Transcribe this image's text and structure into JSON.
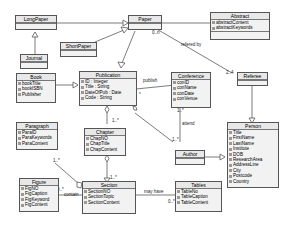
{
  "classes": {
    "longpaper": {
      "name": "LongPaper"
    },
    "paper": {
      "name": "Paper"
    },
    "abstract": {
      "name": "Abstract",
      "attrs": [
        "abstractContent",
        "abstractKeywords"
      ]
    },
    "journal": {
      "name": "Journal"
    },
    "shortpaper": {
      "name": "ShortPaper"
    },
    "book": {
      "name": "Book",
      "attrs": [
        "bookTitle",
        "bookISBN",
        "Publisher"
      ]
    },
    "publication": {
      "name": "Publication",
      "attrs": [
        "ID : Integer",
        "Title : String",
        "DateOfPub : Date",
        "Code : String"
      ]
    },
    "conference": {
      "name": "Conference",
      "attrs": [
        "conID",
        "conName",
        "conDate",
        "conVenue"
      ]
    },
    "referee": {
      "name": "Referee"
    },
    "paragraph": {
      "name": "Paragraph",
      "attrs": [
        "ParaID",
        "ParaKeywords",
        "ParaContent"
      ]
    },
    "chapter": {
      "name": "Chapter",
      "attrs": [
        "ChapNO",
        "ChapTitle",
        "ChapContent"
      ]
    },
    "author": {
      "name": "Author"
    },
    "person": {
      "name": "Person",
      "attrs": [
        "Title",
        "FirstName",
        "LastName",
        "Institute",
        "DOB",
        "ResearchArea",
        "AddressLine",
        "City",
        "Postcode",
        "Country"
      ]
    },
    "figure": {
      "name": "Figure",
      "attrs": [
        "FigNO",
        "FigCaption",
        "FigKeyword",
        "FigContent"
      ]
    },
    "section": {
      "name": "Section",
      "attrs": [
        "SectionNO",
        "SectionTopic",
        "SectionContent"
      ]
    },
    "tables": {
      "name": "Tables",
      "attrs": [
        "TableNo",
        "TableCaption",
        "TableContent"
      ]
    }
  },
  "labels": {
    "refered_by": "refered by",
    "mult_0n": "0..n",
    "mult_24": "2..4",
    "publish": "publish",
    "attend": "attend",
    "mult_conf": "1..*",
    "mult_author": "1..*",
    "mult_chapter": "1..*",
    "mult_section": "1..*",
    "mult_para": "1..*",
    "contain": "contain",
    "mult_fig": "0..*",
    "may_have": "may have",
    "mult_tables": "0..*",
    "pub_mult": "*"
  }
}
